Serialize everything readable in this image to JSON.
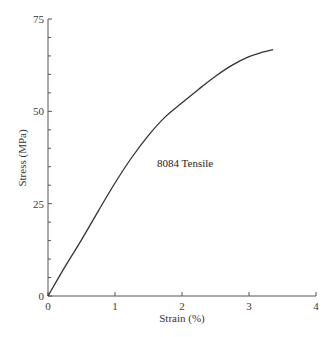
{
  "chart_data": {
    "type": "line",
    "title": "",
    "xlabel": "Strain (%)",
    "ylabel": "Stress (MPa)",
    "xlim": [
      0,
      4
    ],
    "ylim": [
      0,
      75
    ],
    "x_ticks": [
      0,
      1,
      2,
      3,
      4
    ],
    "x_tick_labels": [
      "0",
      "1",
      "2",
      "3",
      "4"
    ],
    "y_ticks": [
      0,
      25,
      50,
      75
    ],
    "y_tick_labels": [
      "0",
      "25",
      "50",
      "75"
    ],
    "y_minor_tick_step": 5,
    "grid": false,
    "legend": null,
    "annotations": [
      {
        "text": "8084 Tensile",
        "x": 2.15,
        "y": 38
      }
    ],
    "series": [
      {
        "name": "8084 Tensile",
        "color": "#333333",
        "x": [
          0,
          0.25,
          0.5,
          0.75,
          1.0,
          1.25,
          1.5,
          1.75,
          2.0,
          2.25,
          2.5,
          2.75,
          3.0,
          3.2,
          3.36
        ],
        "y": [
          0,
          7.8,
          15.2,
          23.0,
          30.6,
          37.5,
          43.5,
          48.5,
          52.3,
          56.0,
          59.5,
          62.5,
          64.8,
          66.0,
          66.7
        ]
      }
    ]
  }
}
